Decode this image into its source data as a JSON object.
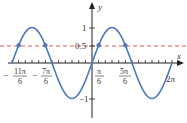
{
  "chart_data": {
    "type": "line",
    "title": "",
    "function": "y = sin(x)",
    "xlabel": "x",
    "ylabel": "y",
    "xlim": [
      -6.2832,
      6.2832
    ],
    "ylim": [
      -1.3,
      1.3
    ],
    "grid": false,
    "series": [
      {
        "name": "sin(x)",
        "color": "#4a78c2",
        "style": "solid"
      },
      {
        "name": "y = 0.5",
        "color": "#e05a4a",
        "style": "dashed",
        "value": 0.5
      }
    ],
    "points": [
      {
        "x": -5.7596,
        "y": 0.5,
        "label": "-11π/6"
      },
      {
        "x": -3.6652,
        "y": 0.5,
        "label": "-7π/6"
      },
      {
        "x": 0.5236,
        "y": 0.5,
        "label": "π/6"
      },
      {
        "x": 2.618,
        "y": 0.5,
        "label": "5π/6"
      }
    ],
    "x_tick_labels": [
      {
        "num": "11π",
        "den": "6",
        "sign": "−"
      },
      {
        "num": "7π",
        "den": "6",
        "sign": "−"
      },
      {
        "num": "π",
        "den": "6",
        "sign": ""
      },
      {
        "num": "5π",
        "den": "6",
        "sign": ""
      },
      {
        "text": "2π"
      }
    ],
    "y_tick_labels": [
      "1",
      "0.5",
      "−1"
    ]
  },
  "labels": {
    "x_axis": "x",
    "y_axis": "y",
    "y1": "1",
    "y05": "0.5",
    "ym1": "−1",
    "xt1_sign": "−",
    "xt1_num": "11π",
    "xt1_den": "6",
    "xt2_sign": "−",
    "xt2_num": "7π",
    "xt2_den": "6",
    "xt3_num": "π",
    "xt3_den": "6",
    "xt4_num": "5π",
    "xt4_den": "6",
    "xt5": "2π"
  }
}
